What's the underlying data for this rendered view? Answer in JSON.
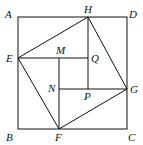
{
  "diagram": {
    "type": "geometry",
    "points": {
      "A": {
        "label": "A",
        "x": 18,
        "y": 17
      },
      "D": {
        "label": "D",
        "x": 127,
        "y": 17
      },
      "B": {
        "label": "B",
        "x": 18,
        "y": 129
      },
      "C": {
        "label": "C",
        "x": 127,
        "y": 129
      },
      "H": {
        "label": "H",
        "x": 88,
        "y": 17
      },
      "E": {
        "label": "E",
        "x": 18,
        "y": 58
      },
      "G": {
        "label": "G",
        "x": 127,
        "y": 89
      },
      "F": {
        "label": "F",
        "x": 59,
        "y": 129
      },
      "M": {
        "label": "M",
        "x": 59,
        "y": 58
      },
      "Q": {
        "label": "Q",
        "x": 88,
        "y": 58
      },
      "N": {
        "label": "N",
        "x": 59,
        "y": 89
      },
      "P": {
        "label": "P",
        "x": 88,
        "y": 89
      }
    },
    "segments": [
      "AD",
      "DC",
      "CB",
      "BA",
      "EH",
      "HG",
      "GF",
      "FE",
      "EQ",
      "HP",
      "GN",
      "FM"
    ]
  }
}
